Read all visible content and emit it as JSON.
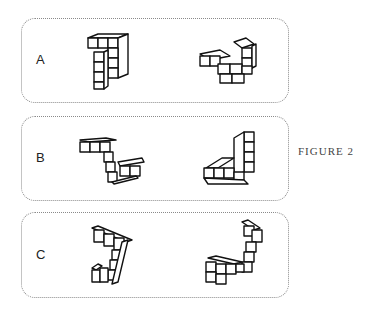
{
  "figure": {
    "caption": "FIGURE 2"
  },
  "panels": [
    {
      "label": "A",
      "shapes": [
        "cube-structure-left",
        "cube-structure-right"
      ]
    },
    {
      "label": "B",
      "shapes": [
        "cube-structure-left",
        "cube-structure-right"
      ]
    },
    {
      "label": "C",
      "shapes": [
        "cube-structure-left",
        "cube-structure-right"
      ]
    }
  ],
  "colors": {
    "outline": "#111111",
    "panel_border": "#8a8a8a",
    "background": "#ffffff"
  }
}
